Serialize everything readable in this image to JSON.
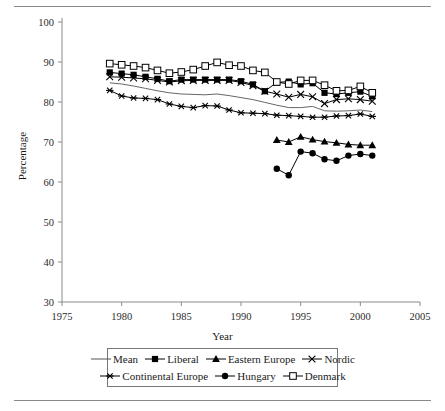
{
  "figure": {
    "top_rule": true,
    "bottom_rule": true
  },
  "axes": {
    "ylabel": "Percentage",
    "xlabel": "Year",
    "yticks": [
      30,
      40,
      50,
      60,
      70,
      80,
      90,
      100
    ],
    "xticks": [
      1975,
      1980,
      1985,
      1990,
      1995,
      2000,
      2005
    ]
  },
  "legend": {
    "rows": [
      [
        {
          "label": "Mean",
          "marker": "line"
        },
        {
          "label": "Liberal",
          "marker": "filled-square"
        },
        {
          "label": "Eastern Europe",
          "marker": "filled-triangle"
        },
        {
          "label": "Nordic",
          "marker": "x-cross"
        }
      ],
      [
        {
          "label": "Continental Europe",
          "marker": "asterisk"
        },
        {
          "label": "Hungary",
          "marker": "filled-circle"
        },
        {
          "label": "Denmark",
          "marker": "open-square"
        }
      ]
    ]
  },
  "chart_data": {
    "type": "line",
    "title": "",
    "xlabel": "Year",
    "ylabel": "Percentage",
    "xlim": [
      1975,
      2005
    ],
    "ylim": [
      30,
      100
    ],
    "xtick_step": 5,
    "ytick_step": 10,
    "grid": false,
    "legend_position": "below-axes",
    "colors": {
      "all_series": "#000000",
      "axis": "#8a8a8a"
    },
    "series": [
      {
        "name": "Mean",
        "marker": "none",
        "style": "thin-line",
        "x": [
          1979,
          1980,
          1981,
          1982,
          1983,
          1984,
          1985,
          1986,
          1987,
          1988,
          1989,
          1990,
          1991,
          1992,
          1993,
          1994,
          1995,
          1996,
          1997,
          1998,
          1999,
          2000,
          2001
        ],
        "values": [
          84.8,
          84.5,
          84.0,
          83.4,
          82.8,
          82.3,
          82.0,
          81.9,
          81.8,
          82.0,
          81.6,
          81.1,
          80.6,
          79.9,
          79.2,
          78.6,
          78.6,
          78.9,
          77.8,
          77.7,
          77.8,
          78.0,
          77.6
        ]
      },
      {
        "name": "Liberal",
        "marker": "filled-square",
        "x": [
          1979,
          1980,
          1981,
          1982,
          1983,
          1984,
          1985,
          1986,
          1987,
          1988,
          1989,
          1990,
          1991,
          1992,
          1993,
          1994,
          1995,
          1996,
          1997,
          1998,
          1999,
          2000,
          2001
        ],
        "values": [
          87.4,
          87.1,
          86.8,
          86.3,
          85.8,
          85.2,
          85.6,
          85.6,
          85.6,
          85.6,
          85.6,
          85.2,
          84.4,
          82.7,
          84.9,
          85.1,
          84.4,
          84.7,
          82.3,
          82.0,
          82.3,
          82.6,
          81.4
        ]
      },
      {
        "name": "Eastern Europe",
        "marker": "filled-triangle",
        "x": [
          1993,
          1994,
          1995,
          1996,
          1997,
          1998,
          1999,
          2000,
          2001
        ],
        "values": [
          70.5,
          70.0,
          71.3,
          70.6,
          70.1,
          69.8,
          69.4,
          69.2,
          69.2
        ]
      },
      {
        "name": "Nordic",
        "marker": "x-cross",
        "x": [
          1979,
          1980,
          1981,
          1982,
          1983,
          1984,
          1985,
          1986,
          1987,
          1988,
          1989,
          1990,
          1991,
          1992,
          1993,
          1994,
          1995,
          1996,
          1997,
          1998,
          1999,
          2000,
          2001
        ],
        "values": [
          86.3,
          86.2,
          86.0,
          85.8,
          85.4,
          85.0,
          85.3,
          85.4,
          85.4,
          85.4,
          85.4,
          84.9,
          84.1,
          82.7,
          82.0,
          81.2,
          81.9,
          81.3,
          79.6,
          80.6,
          80.8,
          80.6,
          80.2
        ]
      },
      {
        "name": "Continental Europe",
        "marker": "asterisk",
        "x": [
          1979,
          1980,
          1981,
          1982,
          1983,
          1984,
          1985,
          1986,
          1987,
          1988,
          1989,
          1990,
          1991,
          1992,
          1993,
          1994,
          1995,
          1996,
          1997,
          1998,
          1999,
          2000,
          2001
        ],
        "values": [
          82.9,
          81.5,
          81.0,
          80.9,
          80.6,
          79.5,
          78.9,
          78.6,
          79.1,
          79.0,
          78.0,
          77.3,
          77.2,
          77.1,
          76.7,
          76.6,
          76.4,
          76.2,
          76.2,
          76.5,
          76.6,
          77.0,
          76.4
        ]
      },
      {
        "name": "Hungary",
        "marker": "filled-circle",
        "x": [
          1993,
          1994,
          1995,
          1996,
          1997,
          1998,
          1999,
          2000,
          2001
        ],
        "values": [
          63.3,
          61.7,
          67.6,
          67.2,
          65.7,
          65.3,
          66.6,
          67.0,
          66.6
        ]
      },
      {
        "name": "Denmark",
        "marker": "open-square",
        "x": [
          1979,
          1980,
          1981,
          1982,
          1983,
          1984,
          1985,
          1986,
          1987,
          1988,
          1989,
          1990,
          1991,
          1992,
          1993,
          1994,
          1995,
          1996,
          1997,
          1998,
          1999,
          2000,
          2001
        ],
        "values": [
          89.6,
          89.3,
          89.0,
          88.6,
          87.9,
          87.2,
          87.5,
          88.1,
          89.0,
          89.9,
          89.2,
          89.0,
          87.9,
          87.4,
          85.0,
          84.5,
          85.4,
          85.4,
          84.2,
          82.8,
          82.9,
          83.9,
          82.3
        ]
      }
    ]
  }
}
